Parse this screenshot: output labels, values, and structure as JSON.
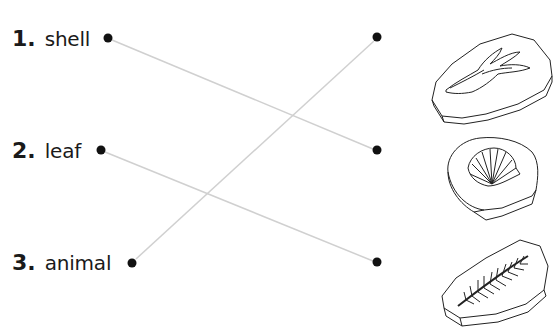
{
  "worksheet": {
    "items": [
      {
        "number": "1.",
        "label": "shell"
      },
      {
        "number": "2.",
        "label": "leaf"
      },
      {
        "number": "3.",
        "label": "animal"
      }
    ],
    "fossils": [
      {
        "icon": "animal-footprint-fossil-icon"
      },
      {
        "icon": "shell-fossil-icon"
      },
      {
        "icon": "leaf-fossil-icon"
      }
    ],
    "connections": [
      {
        "from": "shell",
        "to_fossil_index": 2
      },
      {
        "from": "leaf",
        "to_fossil_index": 3
      },
      {
        "from": "animal",
        "to_fossil_index": 1
      }
    ],
    "colors": {
      "line": "#d0d0d0",
      "dot": "#111111",
      "text": "#1a1a1a"
    }
  }
}
